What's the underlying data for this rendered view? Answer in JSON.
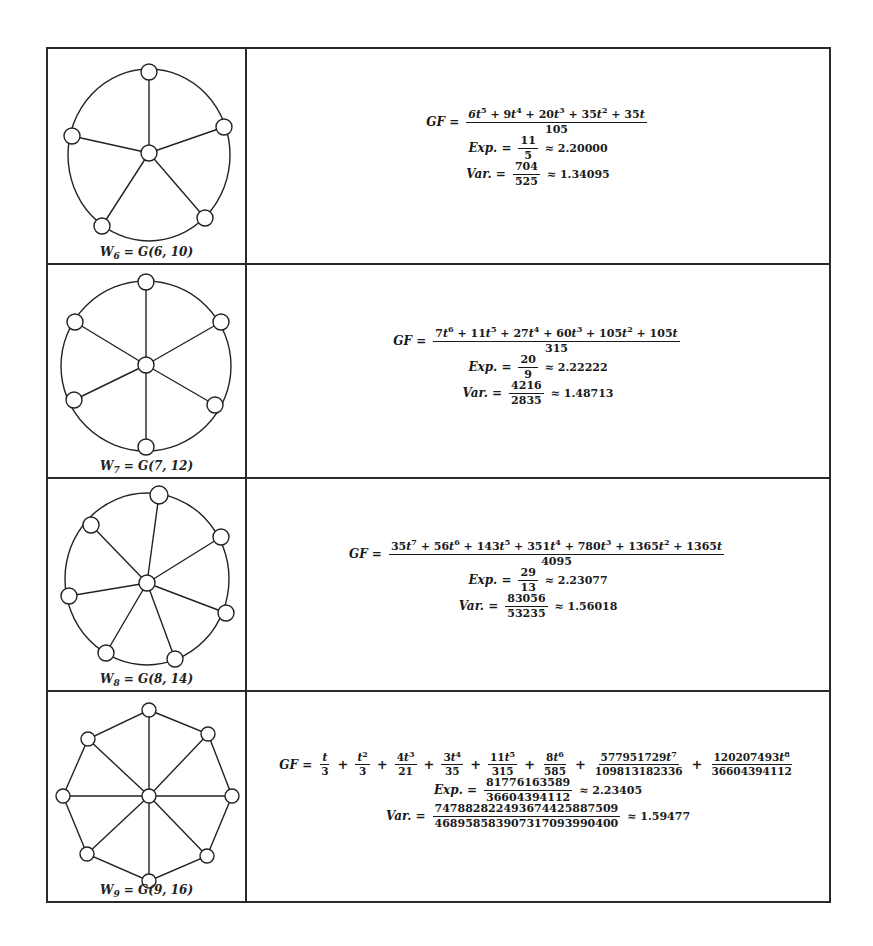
{
  "rows": [
    {
      "graph": {
        "label": "W6 = G(6, 10)",
        "label_parts": {
          "w": "W",
          "sub": "6",
          "rest": " = G(6, 10)"
        },
        "n": 6,
        "edges": 10,
        "shape": "wheel with circular rim, 5 outer vertices"
      },
      "gf": {
        "lhs": "GF =",
        "numerator": "6t^5 + 9t^4 + 20t^3 + 35t^2 + 35t",
        "denominator": "105"
      },
      "exp": {
        "lhs": "Exp. =",
        "num": "11",
        "den": "5",
        "approx": "≈ 2.20000"
      },
      "var": {
        "lhs": "Var. =",
        "num": "704",
        "den": "525",
        "approx": "≈ 1.34095"
      }
    },
    {
      "graph": {
        "label": "W7 = G(7, 12)",
        "label_parts": {
          "w": "W",
          "sub": "7",
          "rest": " = G(7, 12)"
        },
        "n": 7,
        "edges": 12,
        "shape": "wheel with circular rim, 6 outer vertices"
      },
      "gf": {
        "lhs": "GF =",
        "numerator": "7t^6 + 11t^5 + 27t^4 + 60t^3 + 105t^2 + 105t",
        "denominator": "315"
      },
      "exp": {
        "lhs": "Exp. =",
        "num": "20",
        "den": "9",
        "approx": "≈ 2.22222"
      },
      "var": {
        "lhs": "Var. =",
        "num": "4216",
        "den": "2835",
        "approx": "≈ 1.48713"
      }
    },
    {
      "graph": {
        "label": "W8 = G(8, 14)",
        "label_parts": {
          "w": "W",
          "sub": "8",
          "rest": " = G(8, 14)"
        },
        "n": 8,
        "edges": 14,
        "shape": "wheel with circular rim, 7 outer vertices"
      },
      "gf": {
        "lhs": "GF =",
        "numerator": "35t^7 + 56t^6 + 143t^5 + 351t^4 + 780t^3 + 1365t^2 + 1365t",
        "denominator": "4095"
      },
      "exp": {
        "lhs": "Exp. =",
        "num": "29",
        "den": "13",
        "approx": "≈ 2.23077"
      },
      "var": {
        "lhs": "Var. =",
        "num": "83056",
        "den": "53235",
        "approx": "≈ 1.56018"
      }
    },
    {
      "graph": {
        "label": "W9 = G(9, 16)",
        "label_parts": {
          "w": "W",
          "sub": "9",
          "rest": " = G(9, 16)"
        },
        "n": 9,
        "edges": 16,
        "shape": "wheel with octagonal rim, 8 outer vertices"
      },
      "gf": {
        "lhs": "GF =",
        "terms": [
          {
            "num": "t",
            "den": "3"
          },
          {
            "num": "t^2",
            "den": "3"
          },
          {
            "num": "4t^3",
            "den": "21"
          },
          {
            "num": "3t^4",
            "den": "35"
          },
          {
            "num": "11t^5",
            "den": "315"
          },
          {
            "num": "8t^6",
            "den": "585"
          },
          {
            "num": "577951729t^7",
            "den": "109813182336"
          },
          {
            "num": "120207493t^8",
            "den": "36604394112"
          }
        ]
      },
      "exp": {
        "lhs": "Exp. =",
        "num": "81776163589",
        "den": "36604394112",
        "approx": "≈ 2.23405"
      },
      "var": {
        "lhs": "Var. =",
        "num": "747882822493674425887509",
        "den": "468958583907317093990400",
        "approx": "≈ 1.59477"
      }
    }
  ]
}
